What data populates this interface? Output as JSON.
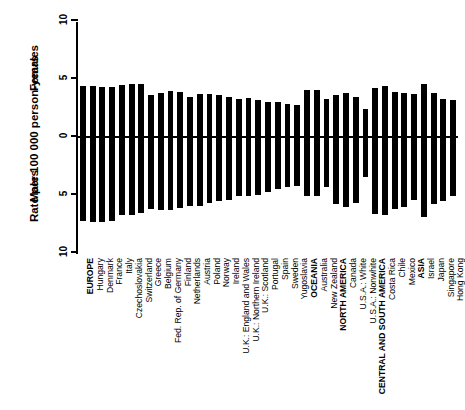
{
  "axis": {
    "ylabel": "Rate per 100 000 person-years",
    "females_label": "Females",
    "males_label": "Males",
    "ticks": [
      "10",
      "5",
      "0",
      "5",
      "10"
    ]
  },
  "chart_data": {
    "type": "bar",
    "title": "",
    "subtitle": "",
    "xlabel": "",
    "ylabel": "Rate per 100 000 person-years",
    "ylim": [
      -10,
      10
    ],
    "grid": false,
    "legend": [
      "Females",
      "Males"
    ],
    "legend_position": "axis-inline",
    "annotations": [
      "Females (above zero line)",
      "Males (below zero line)"
    ],
    "orientation": "mirrored-vertical",
    "color": "#000000",
    "categories": [
      "EUROPE",
      "Hungary",
      "Denmark",
      "France",
      "Italy",
      "Czechoslovakia",
      "Switzerland",
      "Greece",
      "Belgium",
      "Fed. Rep. of Germany",
      "Finland",
      "Netherlands",
      "Austria",
      "Poland",
      "Norway",
      "Ireland",
      "U.K.: England and Wales",
      "U.K.: Northern Ireland",
      "U.K.: Scotland",
      "Portugal",
      "Spain",
      "Sweden",
      "Yugoslavia",
      "OCEANIA",
      "Australia",
      "New Zealand",
      "NORTH AMERICA",
      "Canada",
      "U.S.A.: White",
      "U.S.A.: Nonwhite",
      "CENTRAL AND SOUTH AMERICA",
      "Costa Rica",
      "Chile",
      "Mexico",
      "ASIA",
      "Israel",
      "Japan",
      "Singapore",
      "Hong Kong"
    ],
    "series": [
      {
        "name": "Females",
        "ylabel": "Rate per 100 000 person-years",
        "values": [
          4.3,
          4.3,
          4.2,
          4.2,
          4.4,
          4.5,
          4.5,
          3.5,
          3.7,
          3.9,
          3.8,
          3.4,
          3.6,
          3.6,
          3.5,
          3.4,
          3.2,
          3.3,
          3.1,
          2.9,
          2.9,
          2.8,
          2.7,
          4.0,
          4.0,
          3.2,
          3.5,
          3.7,
          3.4,
          2.3,
          4.1,
          4.3,
          3.8,
          3.7,
          3.6,
          4.5,
          3.7,
          3.2,
          3.1
        ]
      },
      {
        "name": "Males",
        "ylabel": "Rate per 100 000 person-years",
        "values": [
          7.3,
          7.4,
          7.4,
          7.3,
          6.8,
          6.8,
          6.6,
          6.3,
          6.4,
          6.4,
          6.2,
          6.0,
          6.0,
          5.8,
          5.6,
          5.5,
          5.2,
          5.2,
          5.1,
          4.8,
          4.6,
          4.4,
          4.3,
          5.2,
          5.2,
          4.4,
          5.9,
          6.1,
          5.8,
          3.5,
          6.7,
          6.8,
          6.3,
          6.1,
          5.5,
          7.0,
          5.9,
          5.6,
          5.2
        ]
      }
    ],
    "bold_categories": [
      "EUROPE",
      "OCEANIA",
      "NORTH AMERICA",
      "CENTRAL AND SOUTH AMERICA",
      "ASIA"
    ]
  }
}
